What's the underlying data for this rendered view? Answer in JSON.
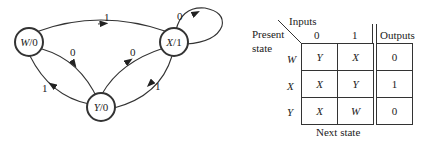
{
  "diagram": {
    "states": [
      {
        "id": "W",
        "label": "W/0",
        "name": "W",
        "output": "0"
      },
      {
        "id": "X",
        "label": "X/1",
        "name": "X",
        "output": "1"
      },
      {
        "id": "Y",
        "label": "Y/0",
        "name": "Y",
        "output": "0"
      }
    ],
    "transitions": [
      {
        "from": "W",
        "to": "X",
        "input": "1"
      },
      {
        "from": "W",
        "to": "Y",
        "input": "0"
      },
      {
        "from": "Y",
        "to": "W",
        "input": "1"
      },
      {
        "from": "Y",
        "to": "X",
        "input": "0"
      },
      {
        "from": "X",
        "to": "Y",
        "input": "1"
      },
      {
        "from": "X",
        "to": "X",
        "input": "0"
      }
    ]
  },
  "table": {
    "corner_top": "Inputs",
    "corner_left_1": "Present",
    "corner_left_2": "state",
    "input_headers": [
      "0",
      "1"
    ],
    "outputs_header": "Outputs",
    "footer": "Next state",
    "rows": [
      {
        "state": "W",
        "next0": "Y",
        "next1": "X",
        "output": "0"
      },
      {
        "state": "X",
        "next0": "X",
        "next1": "Y",
        "output": "1"
      },
      {
        "state": "Y",
        "next0": "X",
        "next1": "W",
        "output": "0"
      }
    ]
  }
}
